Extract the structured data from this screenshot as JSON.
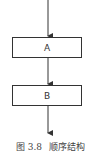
{
  "diagram": {
    "type": "flowchart",
    "nodes": [
      {
        "id": "A",
        "label": "A"
      },
      {
        "id": "B",
        "label": "B"
      }
    ],
    "edges": [
      {
        "from": "start",
        "to": "A"
      },
      {
        "from": "A",
        "to": "B"
      },
      {
        "from": "B",
        "to": "end"
      }
    ]
  },
  "caption": {
    "figure_number": "图 3.8",
    "title": "顺序结构"
  }
}
